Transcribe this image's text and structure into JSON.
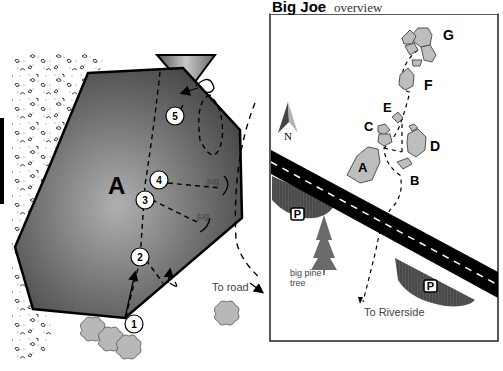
{
  "overview": {
    "title": "Big Joe",
    "subtitle": "overview",
    "boulders": [
      {
        "id": "G",
        "label": "G"
      },
      {
        "id": "F",
        "label": "F"
      },
      {
        "id": "E",
        "label": "E"
      },
      {
        "id": "C",
        "label": "C"
      },
      {
        "id": "D",
        "label": "D"
      },
      {
        "id": "A",
        "label": "A"
      },
      {
        "id": "B",
        "label": "B"
      }
    ],
    "compass_label": "N",
    "parking_label": "P",
    "tree_label_line1": "big pine",
    "tree_label_line2": "tree",
    "trail_label": "To Riverside"
  },
  "detail": {
    "boulder_label": "A",
    "routes": [
      "1",
      "2",
      "3",
      "4",
      "5"
    ],
    "hold_labels": [
      "jug",
      "jug"
    ],
    "road_label": "To road"
  },
  "colors": {
    "boulder_fill": "#bdbdbd",
    "boulder_dark": "#3a3a3a",
    "road": "#000000",
    "parking_fill": "#5a5a5a",
    "bush_fill": "#b8b8b8"
  }
}
